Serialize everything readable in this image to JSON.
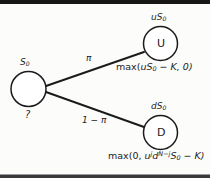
{
  "figure": {
    "type": "binomial-option-pricing-tree",
    "background_color": "#fcfcfb",
    "ink_color": "#1b1b1b"
  },
  "nodes": {
    "root": {
      "letter": "",
      "value_label": "S",
      "value_sub": "0",
      "unknown_label": "?"
    },
    "up": {
      "letter": "U",
      "value_label": "uS",
      "value_sub": "0",
      "payoff_prefix": "max(",
      "payoff_body": "uS",
      "payoff_sub": "0",
      "payoff_suffix": " − K, 0)"
    },
    "down": {
      "letter": "D",
      "value_label": "dS",
      "value_sub": "0",
      "payoff_prefix": "max(0, ",
      "payoff_u": "u",
      "payoff_u_exp": "j",
      "payoff_d": "d",
      "payoff_d_exp": "N−j",
      "payoff_s": "S",
      "payoff_s_sub": "0",
      "payoff_suffix": " − K)"
    }
  },
  "branches": {
    "up_probability": "π",
    "down_probability": "1 − π"
  }
}
